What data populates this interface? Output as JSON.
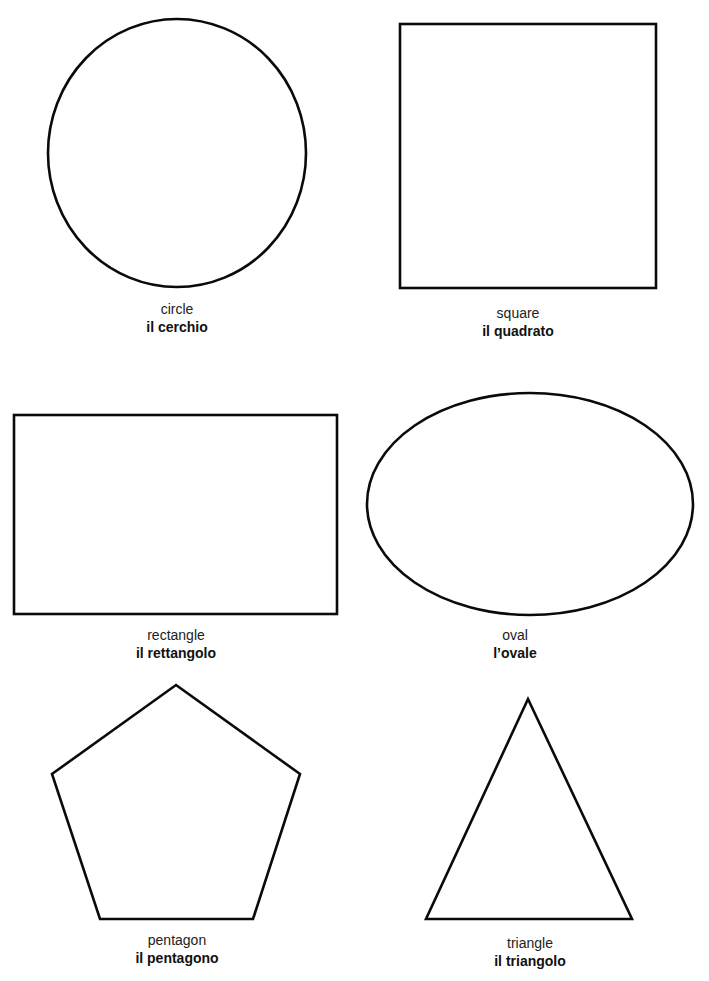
{
  "page": {
    "background": "#ffffff",
    "stroke_color": "#0a0a0a"
  },
  "shapes": [
    {
      "id": "circle",
      "english": "circle",
      "italian": "il cerchio"
    },
    {
      "id": "square",
      "english": "square",
      "italian": "il quadrato"
    },
    {
      "id": "rectangle",
      "english": "rectangle",
      "italian": "il rettangolo"
    },
    {
      "id": "oval",
      "english": "oval",
      "italian": "l’ovale"
    },
    {
      "id": "pentagon",
      "english": "pentagon",
      "italian": "il pentagono"
    },
    {
      "id": "triangle",
      "english": "triangle",
      "italian": "il triangolo"
    }
  ]
}
